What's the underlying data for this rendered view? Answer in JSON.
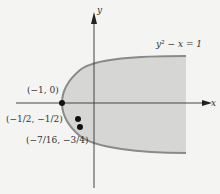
{
  "diagram": {
    "equation": "y² − x = 1",
    "axes": {
      "x_label": "x",
      "y_label": "y"
    },
    "points": [
      {
        "label": "(−1, 0)",
        "x": -1,
        "y": 0
      },
      {
        "label": "(−1/2, −1/2)",
        "x": -0.5,
        "y": -0.5
      },
      {
        "label": "(−7/16, −3/4)",
        "x": -0.4375,
        "y": -0.75
      }
    ],
    "colors": {
      "region_fill": "#d6d6d4",
      "curve": "#8a8a8a",
      "axis": "#444444",
      "point": "#111111"
    }
  }
}
